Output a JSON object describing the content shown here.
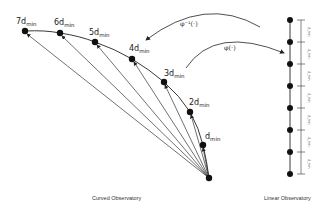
{
  "diagram": {
    "curved_observatory": {
      "caption": "Curved Observatory",
      "origin": {
        "x": 209,
        "y": 178
      },
      "nodes": [
        {
          "label": "7d",
          "sub": "min",
          "x": 25,
          "y": 31
        },
        {
          "label": "6d",
          "sub": "min",
          "x": 60,
          "y": 33
        },
        {
          "label": "5d",
          "sub": "min",
          "x": 95,
          "y": 42
        },
        {
          "label": "4d",
          "sub": "min",
          "x": 132,
          "y": 59
        },
        {
          "label": "3d",
          "sub": "min",
          "x": 164,
          "y": 82
        },
        {
          "label": "2d",
          "sub": "min",
          "x": 190,
          "y": 112
        },
        {
          "label": "d",
          "sub": "min",
          "x": 203,
          "y": 145
        }
      ]
    },
    "linear_observatory": {
      "caption": "Linear Observatory",
      "x": 290,
      "node_ys": [
        20,
        42,
        64,
        86,
        108,
        130,
        152,
        174
      ],
      "segment_label": "d_min"
    },
    "mappings": {
      "inverse": "φ⁻¹(·)",
      "forward": "φ(·)"
    }
  }
}
